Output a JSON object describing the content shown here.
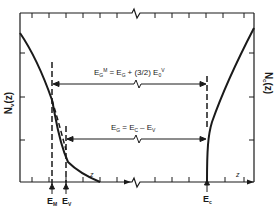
{
  "diagram": {
    "title": "",
    "left_axis_label": "N",
    "left_axis_sub": "v",
    "left_axis_suffix": "(z)",
    "right_axis_label": "N",
    "right_axis_sub": "c",
    "right_axis_suffix": "(z)",
    "top_equation": {
      "lhs": "E",
      "lhs_sub": "G",
      "lhs_sup": "M",
      "rhs": "= E",
      "rhs_sub": "G",
      "rhs_rest": "+ (3/2) E",
      "rhs_rest_sub": "0",
      "rhs_rest_sup": "V"
    },
    "mid_equation": {
      "lhs": "E",
      "lhs_sub": "G",
      "rhs": "= E",
      "rhs_sub": "C",
      "rhs_rest": "– E",
      "rhs_rest_sub": "V"
    },
    "bottom_markers": [
      {
        "label": "E",
        "sub": "M"
      },
      {
        "label": "E",
        "sub": "V"
      },
      {
        "label": "E",
        "sub": "c"
      }
    ],
    "z_label_left": "z",
    "z_label_right": "z",
    "colors": {
      "line": "#1a1a1a",
      "background": "#ffffff"
    }
  }
}
